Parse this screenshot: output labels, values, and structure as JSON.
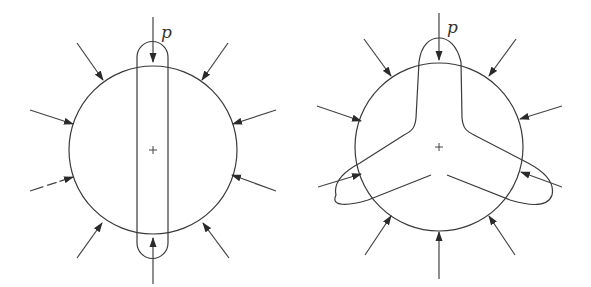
{
  "figures": [
    {
      "id": "left",
      "label": "p",
      "description": "Circular disk under uniform radial pressure with a vertical slender capsule (strip) through center; load p applied at top and bottom",
      "circle": {
        "cx": 153,
        "cy": 150,
        "r": 84
      },
      "insert_shape": "capsule",
      "arrow_count": 10
    },
    {
      "id": "right",
      "label": "p",
      "description": "Circular disk under uniform radial pressure with a three-armed (Y-shaped) cutout extending beyond boundary, load p applied at top",
      "circle": {
        "cx": 439,
        "cy": 147,
        "r": 84
      },
      "insert_shape": "three-lobed",
      "arrow_count": 10
    }
  ],
  "colors": {
    "line": "#3a3a3a",
    "background": "#ffffff"
  }
}
